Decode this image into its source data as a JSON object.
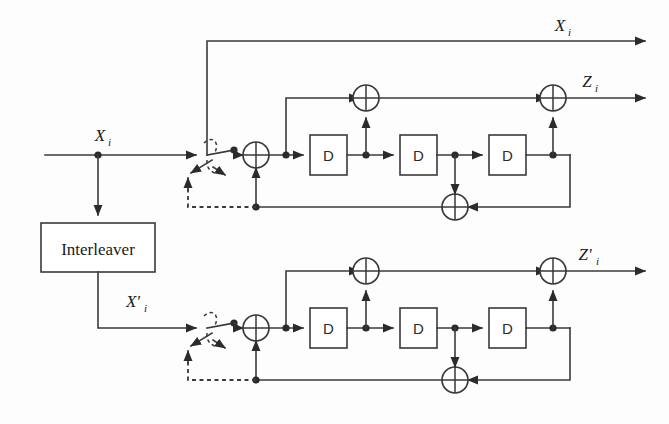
{
  "figure": {
    "kind": "block-diagram",
    "background_color": "#fdfdfd",
    "line_color": "#3a3a3a"
  },
  "labels": {
    "interleaver": "Interleaver",
    "delay": "D",
    "input_x": "X",
    "input_x_sub": "i",
    "output_x": "X",
    "output_x_sub": "i",
    "interleaved_x": "X'",
    "interleaved_x_sub": "i",
    "parity_z": "Z",
    "parity_z_sub": "i",
    "parity_z_prime": "Z'",
    "parity_z_prime_sub": "i"
  },
  "blocks": [
    {
      "name": "interleaver",
      "label": "Interleaver",
      "x": 41,
      "y": 223,
      "w": 114,
      "h": 49
    },
    {
      "name": "delay-1-top",
      "label": "D",
      "x": 310,
      "y": 135,
      "w": 37,
      "h": 40
    },
    {
      "name": "delay-2-top",
      "label": "D",
      "x": 400,
      "y": 135,
      "w": 37,
      "h": 40
    },
    {
      "name": "delay-3-top",
      "label": "D",
      "x": 489,
      "y": 135,
      "w": 37,
      "h": 40
    },
    {
      "name": "delay-1-bottom",
      "label": "D",
      "x": 310,
      "y": 308,
      "w": 37,
      "h": 40
    },
    {
      "name": "delay-2-bottom",
      "label": "D",
      "x": 400,
      "y": 308,
      "w": 37,
      "h": 40
    },
    {
      "name": "delay-3-bottom",
      "label": "D",
      "x": 489,
      "y": 308,
      "w": 37,
      "h": 40
    }
  ],
  "adders": [
    {
      "name": "input-adder-top",
      "cx": 256,
      "cy": 155,
      "r": 13
    },
    {
      "name": "feedforward-adder-top",
      "cx": 366,
      "cy": 98,
      "r": 13
    },
    {
      "name": "output-adder-top",
      "cx": 553,
      "cy": 98,
      "r": 13
    },
    {
      "name": "feedback-adder-top",
      "cx": 455,
      "cy": 207,
      "r": 13
    },
    {
      "name": "input-adder-bottom",
      "cx": 256,
      "cy": 328,
      "r": 13
    },
    {
      "name": "feedforward-adder-bottom",
      "cx": 366,
      "cy": 271,
      "r": 13
    },
    {
      "name": "output-adder-bottom",
      "cx": 553,
      "cy": 271,
      "r": 13
    },
    {
      "name": "feedback-adder-bottom",
      "cx": 455,
      "cy": 380,
      "r": 13
    }
  ],
  "signal_labels": [
    {
      "name": "input-signal-label",
      "base": "X",
      "sub": "i",
      "x": 100,
      "y": 137
    },
    {
      "name": "systematic-output-label",
      "base": "X",
      "sub": "i",
      "x": 560,
      "y": 27
    },
    {
      "name": "interleaved-signal-label",
      "base": "X'",
      "sub": "i",
      "x": 135,
      "y": 303
    },
    {
      "name": "parity-output-label",
      "base": "Z",
      "sub": "i",
      "x": 589,
      "y": 83
    },
    {
      "name": "parity-prime-output-label",
      "base": "Z'",
      "sub": "i",
      "x": 589,
      "y": 256
    }
  ],
  "switches": [
    {
      "name": "trellis-switch-top",
      "pivot_x": 213,
      "pivot_y": 155
    },
    {
      "name": "trellis-switch-bottom",
      "pivot_x": 213,
      "pivot_y": 328
    }
  ],
  "encoders": [
    {
      "name": "upper-rsc-encoder",
      "description": "Recursive systematic convolutional encoder, upper branch",
      "output": "Z"
    },
    {
      "name": "lower-rsc-encoder",
      "description": "Recursive systematic convolutional encoder, lower branch",
      "output": "Z'"
    }
  ]
}
